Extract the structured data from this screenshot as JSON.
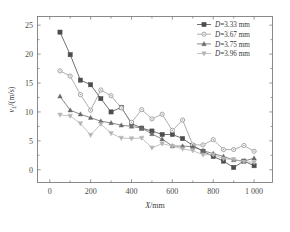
{
  "chart_data": {
    "type": "line",
    "title": "",
    "xlabel": "X/mm",
    "ylabel": "v_L/(m/s)",
    "ylabel_parts": {
      "symbol": "v",
      "subscript": "L",
      "units": "/(m/s)"
    },
    "xlabel_parts": {
      "symbol": "X",
      "units": "/mm"
    },
    "xlim": [
      -60,
      1090
    ],
    "ylim": [
      -2.2,
      26.5
    ],
    "xticks": [
      0,
      200,
      400,
      600,
      800,
      1000
    ],
    "xtick_labels": [
      "0",
      "200",
      "400",
      "600",
      "800",
      "1 000"
    ],
    "yticks": [
      0,
      5,
      10,
      15,
      20,
      25
    ],
    "ytick_labels": [
      "0",
      "5",
      "10",
      "15",
      "20",
      "25"
    ],
    "grid": false,
    "legend_position": "top-right",
    "series": [
      {
        "name": "D=3.33 mm",
        "label_symbol": "D",
        "label_rest": "=3.33 mm",
        "marker": "square",
        "color": "#4d4d4d",
        "x": [
          50,
          100,
          150,
          200,
          250,
          300,
          350,
          400,
          450,
          500,
          550,
          600,
          650,
          700,
          750,
          800,
          850,
          900,
          950,
          1000
        ],
        "y": [
          23.8,
          19.9,
          15.5,
          14.7,
          12.3,
          10.0,
          10.8,
          8.0,
          7.2,
          6.7,
          6.1,
          6.1,
          5.4,
          4.2,
          3.2,
          2.3,
          1.5,
          0.4,
          1.5,
          0.7
        ]
      },
      {
        "name": "D=3.67 mm",
        "label_symbol": "D",
        "label_rest": "=3.67 mm",
        "marker": "circle",
        "color": "#9a9a9a",
        "x": [
          50,
          100,
          150,
          200,
          250,
          300,
          350,
          400,
          450,
          500,
          550,
          600,
          650,
          700,
          750,
          800,
          850,
          900,
          950,
          1000
        ],
        "y": [
          17.1,
          16.2,
          13.0,
          10.3,
          13.8,
          12.8,
          10.7,
          8.2,
          10.4,
          8.8,
          9.6,
          6.8,
          8.6,
          4.3,
          4.3,
          5.2,
          3.5,
          3.5,
          4.2,
          3.2
        ]
      },
      {
        "name": "D=3.75 mm",
        "label_symbol": "D",
        "label_rest": "=3.75 mm",
        "marker": "triangle-up",
        "color": "#6a6a6a",
        "x": [
          50,
          100,
          150,
          200,
          250,
          300,
          350,
          400,
          450,
          500,
          550,
          600,
          650,
          700,
          750,
          800,
          850,
          900,
          950,
          1000
        ],
        "y": [
          12.7,
          10.3,
          9.6,
          9.0,
          8.4,
          8.1,
          7.7,
          7.5,
          7.2,
          6.2,
          5.3,
          4.1,
          4.1,
          4.0,
          3.3,
          2.8,
          2.3,
          1.7,
          1.5,
          2.0
        ]
      },
      {
        "name": "D=3.96 mm",
        "label_symbol": "D",
        "label_rest": "=3.96 mm",
        "marker": "triangle-down",
        "color": "#b4b4b4",
        "x": [
          50,
          100,
          150,
          200,
          250,
          300,
          350,
          400,
          450,
          500,
          550,
          600,
          650,
          700,
          750,
          800,
          850,
          900,
          950,
          1000
        ],
        "y": [
          9.5,
          9.3,
          8.0,
          6.0,
          7.9,
          6.3,
          5.5,
          5.4,
          5.5,
          3.8,
          4.5,
          4.1,
          3.6,
          3.3,
          2.6,
          2.6,
          1.9,
          1.8,
          1.4,
          1.3
        ]
      }
    ]
  }
}
